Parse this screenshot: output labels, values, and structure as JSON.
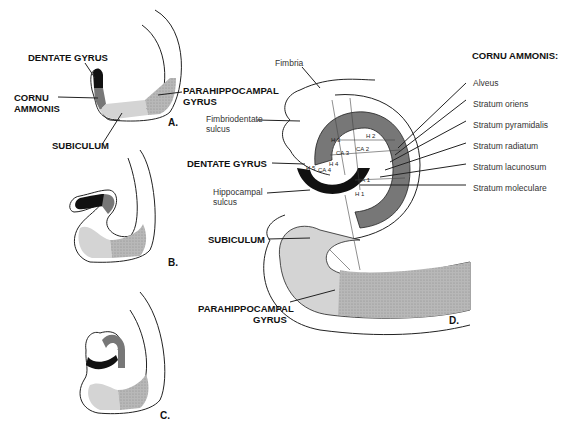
{
  "figure": {
    "panels": [
      "A.",
      "B.",
      "C.",
      "D."
    ],
    "panel_a": {
      "labels": {
        "dentate_gyrus": "DENTATE GYRUS",
        "cornu_ammonis_1": "CORNU",
        "cornu_ammonis_2": "AMMONIS",
        "parahippocampal_1": "PARAHIPPOCAMPAL",
        "parahippocampal_2": "GYRUS",
        "subiculum": "SUBICULUM"
      }
    },
    "panel_d": {
      "labels": {
        "fimbria": "Fimbria",
        "fimbriodentate_1": "Fimbriodentate",
        "fimbriodentate_2": "sulcus",
        "dentate_gyrus": "DENTATE GYRUS",
        "hippocampal_sulcus_1": "Hippocampal",
        "hippocampal_sulcus_2": "sulcus",
        "subiculum": "SUBICULUM",
        "parahippocampal_1": "PARAHIPPOCAMPAL",
        "parahippocampal_2": "GYRUS"
      },
      "inner_labels": [
        "H 1",
        "H 2",
        "H 3",
        "H 4",
        "H 5",
        "CA 1",
        "CA 2",
        "CA 3",
        "CA 4"
      ],
      "cornu_ammonis_legend": {
        "title": "CORNU AMMONIS:",
        "layers": [
          "Alveus",
          "Stratum oriens",
          "Stratum pyramidalis",
          "Stratum radiatum",
          "Stratum lacunosum",
          "Stratum moleculare"
        ]
      }
    },
    "colors": {
      "dentate": "#111111",
      "cornu": "#777777",
      "subiculum": "#d4d4d4",
      "parahippocampal": "#a9a9a9",
      "outline": "#222222"
    }
  }
}
